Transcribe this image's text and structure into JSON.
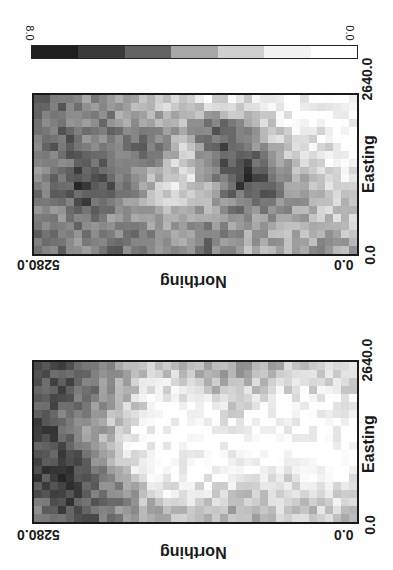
{
  "figure": {
    "orientation": "rotated 90 degrees",
    "colorbar": {
      "max_label": "8.0",
      "min_label": "0.0",
      "segments": [
        "#1e1e1e",
        "#3a3a3a",
        "#636363",
        "#a8a8a8",
        "#d0d0d0",
        "#f2f2f2",
        "#ffffff"
      ]
    },
    "maps": [
      {
        "id": "top",
        "northing_max_label": "5280.0",
        "northing_min_label": "0.0",
        "northing_title": "Northing",
        "easting_min_label": "0.0",
        "easting_max_label": "2640.0",
        "easting_title": "Easting"
      },
      {
        "id": "bottom",
        "northing_max_label": "5280.0",
        "northing_min_label": "0.0",
        "northing_title": "Northing",
        "easting_min_label": "0.0",
        "easting_max_label": "2640.0",
        "easting_title": "Easting"
      }
    ]
  },
  "chart_data": [
    {
      "type": "heatmap",
      "title": "",
      "xlabel": "Northing",
      "ylabel": "Easting",
      "x_range": [
        0.0,
        5280.0
      ],
      "y_range": [
        0.0,
        2640.0
      ],
      "value_range": [
        0.0,
        8.0
      ],
      "colormap": "grayscale (white=0.0, black=8.0), 7 classes",
      "description": "Patchy field: high values (dark) in two large clusters — one near Northing high / Easting mid, another near Northing low-mid / Easting mid; low values (light) bands near Northing mid and Easting high edge.",
      "coarse_grid_rows_easting_high_to_low": [
        [
          6,
          5,
          4,
          4,
          3,
          3,
          2,
          2,
          1,
          1,
          1,
          1,
          0,
          0,
          0,
          0
        ],
        [
          5,
          5,
          4,
          5,
          4,
          4,
          3,
          3,
          5,
          5,
          4,
          2,
          1,
          1,
          0,
          0
        ],
        [
          5,
          6,
          5,
          4,
          5,
          5,
          4,
          2,
          5,
          6,
          5,
          3,
          2,
          1,
          1,
          0
        ],
        [
          4,
          5,
          6,
          6,
          5,
          4,
          3,
          1,
          3,
          6,
          7,
          5,
          3,
          2,
          1,
          1
        ],
        [
          5,
          6,
          7,
          6,
          5,
          3,
          2,
          1,
          3,
          5,
          7,
          6,
          4,
          3,
          2,
          1
        ],
        [
          4,
          5,
          6,
          5,
          4,
          3,
          2,
          2,
          3,
          4,
          5,
          5,
          4,
          3,
          2,
          2
        ],
        [
          5,
          4,
          5,
          4,
          4,
          4,
          3,
          3,
          4,
          4,
          4,
          3,
          3,
          3,
          2,
          2
        ],
        [
          5,
          5,
          4,
          5,
          5,
          5,
          4,
          4,
          5,
          4,
          3,
          3,
          3,
          3,
          4,
          3
        ]
      ]
    },
    {
      "type": "heatmap",
      "title": "",
      "xlabel": "Northing",
      "ylabel": "Easting",
      "x_range": [
        0.0,
        5280.0
      ],
      "y_range": [
        0.0,
        2640.0
      ],
      "value_range": [
        0.0,
        8.0
      ],
      "colormap": "grayscale (white=0.0, black=8.0), 7 classes",
      "description": "High values (dark) concentrated along Northing high edge (left); large low-value (white) region across centre and Northing low side, with moderate patches along both Easting edges.",
      "coarse_grid_rows_easting_high_to_low": [
        [
          6,
          6,
          5,
          4,
          3,
          2,
          2,
          2,
          3,
          3,
          3,
          3,
          2,
          2,
          2,
          1
        ],
        [
          6,
          6,
          5,
          4,
          3,
          1,
          1,
          1,
          2,
          2,
          2,
          1,
          1,
          1,
          1,
          1
        ],
        [
          6,
          5,
          5,
          3,
          2,
          1,
          0,
          0,
          0,
          1,
          1,
          0,
          0,
          0,
          0,
          0
        ],
        [
          7,
          6,
          4,
          3,
          1,
          0,
          0,
          0,
          0,
          0,
          0,
          0,
          0,
          0,
          0,
          0
        ],
        [
          6,
          6,
          5,
          3,
          1,
          0,
          0,
          0,
          0,
          0,
          0,
          0,
          0,
          0,
          0,
          0
        ],
        [
          7,
          7,
          6,
          4,
          2,
          1,
          0,
          0,
          0,
          0,
          0,
          0,
          1,
          0,
          0,
          0
        ],
        [
          6,
          7,
          6,
          5,
          4,
          2,
          1,
          1,
          1,
          2,
          2,
          2,
          2,
          1,
          1,
          1
        ],
        [
          5,
          6,
          6,
          5,
          4,
          3,
          3,
          2,
          2,
          3,
          3,
          2,
          2,
          2,
          2,
          2
        ]
      ]
    }
  ]
}
